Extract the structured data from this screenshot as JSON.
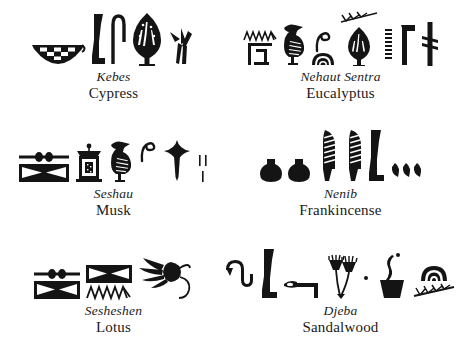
{
  "page": {
    "background_color": "#ffffff",
    "ink_color": "#141414",
    "layout": "2 columns x 3 rows grid of hieroglyph groups with captions"
  },
  "entries": [
    {
      "transliteration": "Kebes",
      "english": "Cypress",
      "glyphs": [
        "boat-basket-glyph",
        "leg-glyph",
        "shepherds-crook-glyph",
        "tree-glyph",
        "reeds-glyph"
      ]
    },
    {
      "transliteration": "Nehaut Sentra",
      "english": "Eucalyptus",
      "glyphs": [
        "water-ripple-glyph",
        "enclosure-square-glyph",
        "bird-glyph",
        "coil-glyph",
        "hill-mound-glyph",
        "branch-glyph",
        "tree-glyph",
        "triple-tick-column-glyph",
        "bent-staff-glyph",
        "pestle-glyph"
      ]
    },
    {
      "transliteration": "Seshau",
      "english": "Musk",
      "glyphs": [
        "beaded-bar-glyph",
        "folded-cloth-glyph",
        "shrine-box-glyph",
        "bird-glyph",
        "coil-glyph",
        "star-pestle-glyph",
        "tally-strokes-glyph"
      ]
    },
    {
      "transliteration": "Nenib",
      "english": "Frankincense",
      "glyphs": [
        "round-jar-glyph",
        "round-jar-glyph",
        "ribbed-feather-glyph",
        "ribbed-feather-glyph",
        "leg-glyph",
        "three-grains-glyph"
      ]
    },
    {
      "transliteration": "Sesheshen",
      "english": "Lotus",
      "glyphs": [
        "beaded-bar-glyph",
        "folded-cloth-glyph",
        "folded-cloth-glyph",
        "water-ripple-glyph",
        "lotus-flower-glyph"
      ]
    },
    {
      "transliteration": "Djeba",
      "english": "Sandalwood",
      "glyphs": [
        "cobra-glyph",
        "leg-glyph",
        "hoe-glyph",
        "twin-papyrus-glyph",
        "dot-glyph",
        "incense-brazier-glyph",
        "hill-mound-glyph",
        "branch-glyph"
      ]
    }
  ]
}
